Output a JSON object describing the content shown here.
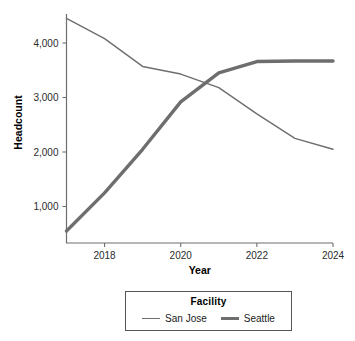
{
  "page": {
    "top_fragment": ""
  },
  "legend": {
    "title": "Facility",
    "position": "bottom-center",
    "entries": [
      {
        "label": "San Jose",
        "style": "thin",
        "color": "#6e6e6e"
      },
      {
        "label": "Seattle",
        "style": "thick",
        "color": "#6e6e6e"
      }
    ]
  },
  "axes": {
    "x_title": "Year",
    "y_title": "Headcount",
    "x_ticks": [
      "2018",
      "2020",
      "2022",
      "2024"
    ],
    "y_ticks": [
      "1,000",
      "2,000",
      "3,000",
      "4,000"
    ]
  },
  "chart_data": {
    "type": "line",
    "title": "",
    "xlabel": "Year",
    "ylabel": "Headcount",
    "x": [
      2017,
      2018,
      2019,
      2020,
      2021,
      2022,
      2023,
      2024
    ],
    "xlim": [
      2017,
      2024
    ],
    "ylim": [
      450,
      4550
    ],
    "xticks": [
      2018,
      2020,
      2022,
      2024
    ],
    "yticks": [
      1000,
      2000,
      3000,
      4000
    ],
    "ytick_labels": [
      "1,000",
      "2,000",
      "3,000",
      "4,000"
    ],
    "grid": false,
    "legend_title": "Facility",
    "legend_position": "bottom-center",
    "series": [
      {
        "name": "San Jose",
        "color": "#6e6e6e",
        "line_width": 1.4,
        "values": [
          4450,
          4080,
          3570,
          3430,
          3180,
          2700,
          2250,
          2050
        ]
      },
      {
        "name": "Seattle",
        "color": "#6e6e6e",
        "line_width": 3.4,
        "values": [
          550,
          1250,
          2050,
          2920,
          3450,
          3660,
          3670,
          3670
        ]
      }
    ]
  }
}
